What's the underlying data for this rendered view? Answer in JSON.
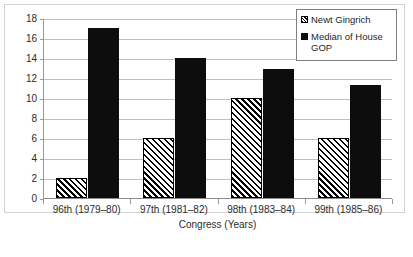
{
  "chart_data": {
    "type": "bar",
    "title": "",
    "xlabel": "Congress (Years)",
    "ylabel": "",
    "ylim": [
      0,
      18
    ],
    "yticks": [
      0,
      2,
      4,
      6,
      8,
      10,
      12,
      14,
      16,
      18
    ],
    "grid": true,
    "legend_position": "top-right",
    "categories": [
      "96th (1979–80)",
      "97th (1981–82)",
      "98th (1983–84)",
      "99th (1985–86)"
    ],
    "series": [
      {
        "name": "Newt Gingrich",
        "marker": "hatched",
        "color": "#ffffff",
        "values": [
          2,
          6,
          10,
          6
        ]
      },
      {
        "name": "Median of House GOP",
        "marker": "solid",
        "color": "#0d0d0d",
        "values": [
          17,
          14,
          12.9,
          11.3
        ]
      }
    ]
  },
  "legend": {
    "entries": [
      {
        "label": "Newt Gingrich"
      },
      {
        "label": "Median of House GOP"
      }
    ]
  },
  "colors": {
    "gridline": "#bfbfbf",
    "axis": "#9a9a9a",
    "frame": "#d3d3d3",
    "series_median": "#0d0d0d",
    "text": "#2b2b2b"
  }
}
